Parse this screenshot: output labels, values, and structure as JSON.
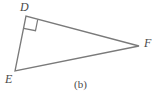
{
  "figure": {
    "caption": "(b)",
    "background_color": "#ffffff",
    "stroke_color": "#7a7a7a",
    "label_color": "#4a4a4a",
    "width": 161,
    "height": 97
  },
  "diagram": {
    "type": "right-triangle",
    "vertices": [
      {
        "id": "D",
        "label": "D",
        "x": 26,
        "y": 16
      },
      {
        "id": "E",
        "label": "E",
        "x": 15,
        "y": 71
      },
      {
        "id": "F",
        "label": "F",
        "x": 139,
        "y": 46
      }
    ],
    "edges": [
      {
        "id": "DE",
        "from": "D",
        "to": "E"
      },
      {
        "id": "DF",
        "from": "D",
        "to": "F"
      },
      {
        "id": "EF",
        "from": "E",
        "to": "F"
      }
    ],
    "angle_markers": [
      {
        "id": "right-angle-D",
        "at": "D",
        "type": "right-angle",
        "measure": "90"
      }
    ],
    "triangle_path": "M 26 16 L 15 71 L 139 46 Z",
    "right_angle_path": "M 23.6 28.3 L 35.5 30.7 L 37.7 19.7"
  }
}
